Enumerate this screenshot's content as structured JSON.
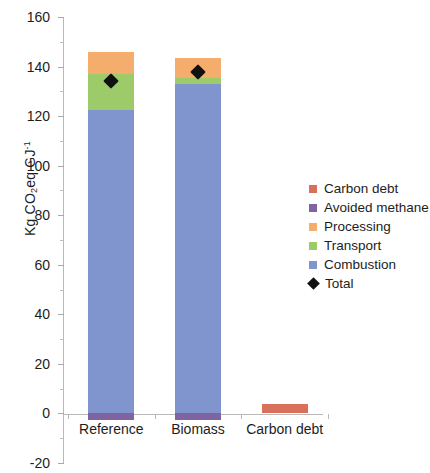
{
  "chart_data": {
    "type": "bar",
    "stacked": true,
    "title": "",
    "xlabel": "",
    "ylabel": "Kg CO2eq GJ-1",
    "ylabel_parts": {
      "prefix": "Kg CO",
      "sub": "2",
      "middle": "eq GJ",
      "sup": "-1"
    },
    "categories": [
      "Reference",
      "Biomass",
      "Carbon debt"
    ],
    "ylim": [
      -20,
      160
    ],
    "yticks": [
      -20,
      0,
      20,
      40,
      60,
      80,
      100,
      120,
      140,
      160
    ],
    "ytick_labels": [
      "-20",
      "0",
      "20",
      "40",
      "60",
      "80",
      "100",
      "120",
      "140",
      "160"
    ],
    "minor_ticks": [
      -10,
      10,
      30,
      50,
      70,
      90,
      110,
      130,
      150
    ],
    "grid": false,
    "legend_position": "right",
    "series": [
      {
        "name": "Carbon debt",
        "color": "#d9705c",
        "values": [
          0,
          0,
          4
        ]
      },
      {
        "name": "Avoided methane",
        "color": "#8064a2",
        "values": [
          -2.5,
          -2.5,
          0
        ]
      },
      {
        "name": "Processing",
        "color": "#f5ad6e",
        "values": [
          9,
          8,
          0
        ]
      },
      {
        "name": "Transport",
        "color": "#9ecb6a",
        "values": [
          14.5,
          2.5,
          0
        ]
      },
      {
        "name": "Combustion",
        "color": "#8094ce",
        "values": [
          122.5,
          133,
          0
        ]
      }
    ],
    "markers": {
      "name": "Total",
      "color": "#111111",
      "values": [
        134,
        138,
        null
      ]
    }
  },
  "legend": {
    "items": [
      {
        "label": "Carbon debt",
        "color": "#d9705c",
        "shape": "square"
      },
      {
        "label": "Avoided methane",
        "color": "#8064a2",
        "shape": "square"
      },
      {
        "label": "Processing",
        "color": "#f5ad6e",
        "shape": "square"
      },
      {
        "label": "Transport",
        "color": "#9ecb6a",
        "shape": "square"
      },
      {
        "label": "Combustion",
        "color": "#8094ce",
        "shape": "square"
      },
      {
        "label": "Total",
        "color": "#111111",
        "shape": "diamond"
      }
    ]
  }
}
